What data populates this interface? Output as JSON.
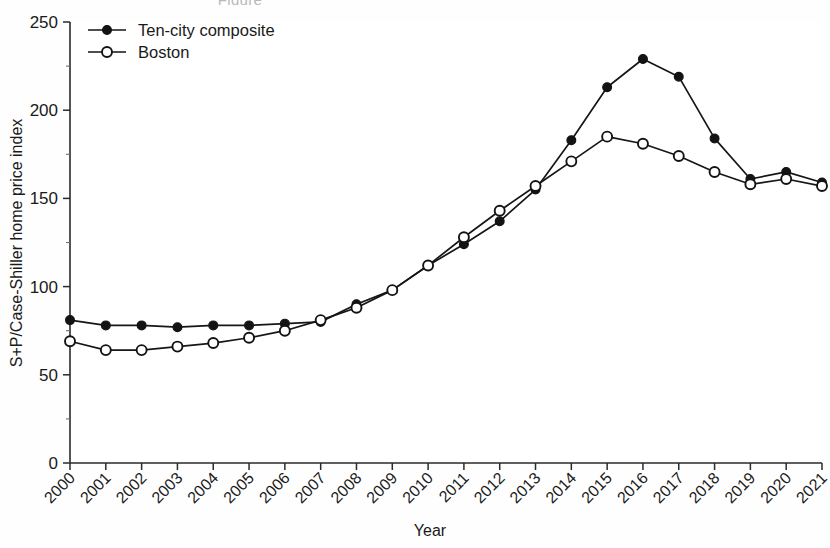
{
  "figure": {
    "caption_fragment": "Figure",
    "background_color": "#fefefe",
    "ink_color": "#131313"
  },
  "chart_data": {
    "type": "line",
    "title": "",
    "xlabel": "Year",
    "ylabel": "S+P/Case-Shiller home price index",
    "categories": [
      "2000",
      "2001",
      "2002",
      "2003",
      "2004",
      "2005",
      "2006",
      "2007",
      "2008",
      "2009",
      "2010",
      "2011",
      "2012",
      "2013",
      "2014",
      "2015",
      "2016",
      "2017",
      "2018",
      "2019",
      "2020",
      "2021"
    ],
    "x": [
      2000,
      2001,
      2002,
      2003,
      2004,
      2005,
      2006,
      2007,
      2008,
      2009,
      2010,
      2011,
      2012,
      2013,
      2014,
      2015,
      2016,
      2017,
      2018,
      2019,
      2020,
      2021
    ],
    "xlim": [
      2000,
      2021
    ],
    "ylim": [
      0,
      250
    ],
    "yticks": [
      0,
      50,
      100,
      150,
      200,
      250
    ],
    "ytick_labels": [
      "0",
      "50",
      "100",
      "150",
      "200",
      "250"
    ],
    "yminor_ticks": [
      25,
      75,
      125,
      175,
      225
    ],
    "xtick_rotation": 45,
    "grid": false,
    "legend_position": "top-left",
    "series": [
      {
        "name": "Ten-city composite",
        "marker": "filled-circle",
        "values": [
          81,
          78,
          78,
          77,
          78,
          78,
          79,
          80,
          90,
          98,
          112,
          124,
          137,
          155,
          183,
          213,
          229,
          219,
          184,
          161,
          165,
          159
        ]
      },
      {
        "name": "Boston",
        "marker": "open-circle",
        "values": [
          69,
          64,
          64,
          66,
          68,
          71,
          75,
          81,
          88,
          98,
          112,
          128,
          143,
          157,
          171,
          185,
          181,
          174,
          165,
          158,
          161,
          157
        ]
      }
    ]
  },
  "legend": {
    "items": [
      {
        "label": "Ten-city composite",
        "marker": "filled-circle"
      },
      {
        "label": "Boston",
        "marker": "open-circle"
      }
    ]
  },
  "axes": {
    "y_title": "S+P/Case-Shiller home price index",
    "x_title": "Year"
  }
}
